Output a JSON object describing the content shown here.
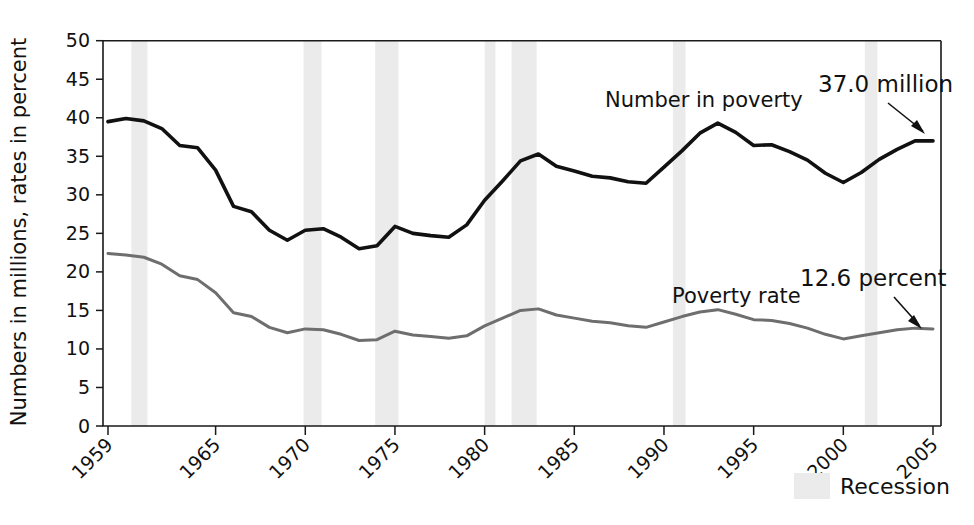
{
  "chart_data": {
    "type": "line",
    "title": "",
    "xlabel": "",
    "ylabel": "Numbers in millions, rates in percent",
    "xlim": [
      1959,
      2005
    ],
    "ylim": [
      0,
      50
    ],
    "grid": false,
    "legend_position": "bottom-right",
    "y_ticks": [
      0,
      5,
      10,
      15,
      20,
      25,
      30,
      35,
      40,
      45,
      50
    ],
    "y_tick_labels": [
      "0",
      "5",
      "10",
      "15",
      "20",
      "25",
      "30",
      "35",
      "40",
      "45",
      "50"
    ],
    "x_ticks": [
      1959,
      1965,
      1970,
      1975,
      1980,
      1985,
      1990,
      1995,
      2000,
      2005
    ],
    "x_tick_labels": [
      "1959",
      "1965",
      "1970",
      "1975",
      "1980",
      "1985",
      "1990",
      "1995",
      "2000",
      "2005"
    ],
    "x": [
      1959,
      1960,
      1961,
      1962,
      1963,
      1964,
      1965,
      1966,
      1967,
      1968,
      1969,
      1970,
      1971,
      1972,
      1973,
      1974,
      1975,
      1976,
      1977,
      1978,
      1979,
      1980,
      1981,
      1982,
      1983,
      1984,
      1985,
      1986,
      1987,
      1988,
      1989,
      1990,
      1991,
      1992,
      1993,
      1994,
      1995,
      1996,
      1997,
      1998,
      1999,
      2000,
      2001,
      2002,
      2003,
      2004,
      2005
    ],
    "series": [
      {
        "name": "Number in poverty",
        "units": "millions",
        "color": "#111111",
        "stroke_width": 3.6,
        "values": [
          39.5,
          39.9,
          39.6,
          38.6,
          36.4,
          36.1,
          33.2,
          28.5,
          27.8,
          25.4,
          24.1,
          25.4,
          25.6,
          24.5,
          23.0,
          23.4,
          25.9,
          25.0,
          24.7,
          24.5,
          26.1,
          29.3,
          31.8,
          34.4,
          35.3,
          33.7,
          33.1,
          32.4,
          32.2,
          31.7,
          31.5,
          33.6,
          35.7,
          38.0,
          39.3,
          38.1,
          36.4,
          36.5,
          35.6,
          34.5,
          32.8,
          31.6,
          32.9,
          34.6,
          35.9,
          37.0,
          37.0
        ]
      },
      {
        "name": "Poverty rate",
        "units": "percent",
        "color": "#6e6e6e",
        "stroke_width": 3.0,
        "values": [
          22.4,
          22.2,
          21.9,
          21.0,
          19.5,
          19.0,
          17.3,
          14.7,
          14.2,
          12.8,
          12.1,
          12.6,
          12.5,
          11.9,
          11.1,
          11.2,
          12.3,
          11.8,
          11.6,
          11.4,
          11.7,
          13.0,
          14.0,
          15.0,
          15.2,
          14.4,
          14.0,
          13.6,
          13.4,
          13.0,
          12.8,
          13.5,
          14.2,
          14.8,
          15.1,
          14.5,
          13.8,
          13.7,
          13.3,
          12.7,
          11.9,
          11.3,
          11.7,
          12.1,
          12.5,
          12.7,
          12.6
        ]
      }
    ],
    "recessions": [
      {
        "start": 1960.3,
        "end": 1961.2
      },
      {
        "start": 1969.9,
        "end": 1970.9
      },
      {
        "start": 1973.9,
        "end": 1975.2
      },
      {
        "start": 1980.0,
        "end": 1980.6
      },
      {
        "start": 1981.5,
        "end": 1982.9
      },
      {
        "start": 1990.5,
        "end": 1991.2
      },
      {
        "start": 2001.2,
        "end": 2001.9
      }
    ],
    "annotations": [
      {
        "id": "number-in-poverty-label",
        "text": "Number in poverty",
        "x": 605,
        "y": 107
      },
      {
        "id": "number-in-poverty-value",
        "text": "37.0 million",
        "x": 818,
        "y": 92
      },
      {
        "id": "poverty-rate-label",
        "text": "Poverty rate",
        "x": 672,
        "y": 303
      },
      {
        "id": "poverty-rate-value",
        "text": "12.6 percent",
        "x": 800,
        "y": 286
      }
    ],
    "legend": [
      {
        "id": "recession",
        "label": "Recession",
        "color": "#ebebeb"
      }
    ]
  }
}
